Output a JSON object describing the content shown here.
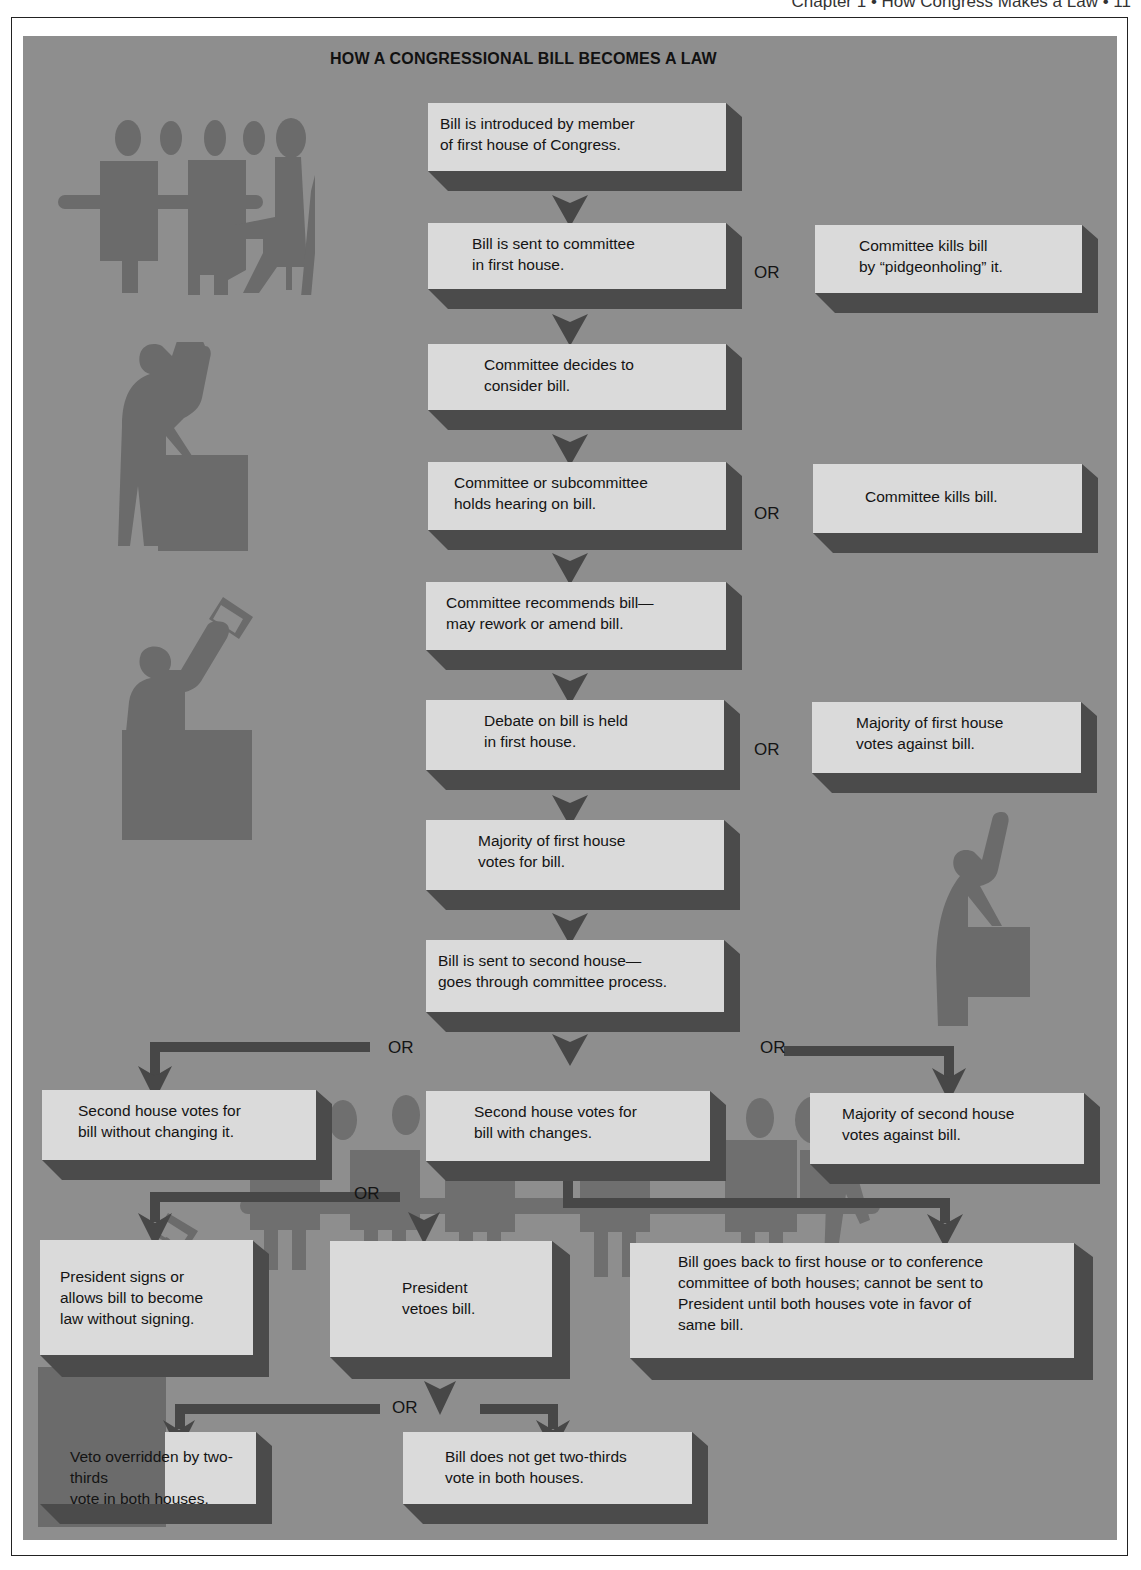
{
  "page": {
    "running_head": "Chapter 1 • How Congress Makes a Law • 11"
  },
  "diagram": {
    "title": "HOW A CONGRESSIONAL BILL BECOMES A LAW",
    "or_label": "OR",
    "colors": {
      "panel": "#8e8e8e",
      "box_face": "#dadada",
      "box_shadow": "#4b4b4b",
      "arrow": "#474747",
      "silhouette": "#6b6b6b"
    },
    "steps": [
      {
        "id": "s1",
        "text": "Bill is introduced by member\nof first house of Congress."
      },
      {
        "id": "s2",
        "text": "Bill is sent to committee\nin first house."
      },
      {
        "id": "s3",
        "text": "Committee decides to\nconsider bill."
      },
      {
        "id": "s4",
        "text": "Committee or subcommittee\nholds hearing on bill."
      },
      {
        "id": "s5",
        "text": "Committee recommends bill—\nmay rework or amend bill."
      },
      {
        "id": "s6",
        "text": "Debate on bill is held\nin first house."
      },
      {
        "id": "s7",
        "text": "Majority of first house\nvotes for bill."
      },
      {
        "id": "s8",
        "text": "Bill is sent to second house—\ngoes through committee process."
      }
    ],
    "alternatives": [
      {
        "id": "a1",
        "text": "Committee kills bill\nby “pidgeonholing” it."
      },
      {
        "id": "a2",
        "text": "Committee kills bill."
      },
      {
        "id": "a3",
        "text": "Majority of first house\nvotes against bill."
      }
    ],
    "second_house": [
      {
        "id": "b1",
        "text": "Second house votes for\nbill without changing it."
      },
      {
        "id": "b2",
        "text": "Second house votes for\nbill with changes."
      },
      {
        "id": "b3",
        "text": "Majority of second house\nvotes against bill."
      }
    ],
    "president": [
      {
        "id": "p1",
        "text": "President signs or\nallows bill to become\nlaw without signing."
      },
      {
        "id": "p2",
        "text": "President\nvetoes bill."
      },
      {
        "id": "p3",
        "text": "Bill goes back to first house or to conference\ncommittee of both houses; cannot be sent to\nPresident until both houses vote in favor of\nsame bill."
      }
    ],
    "veto": [
      {
        "id": "v1",
        "text": "Veto overridden by two-thirds\nvote in both houses."
      },
      {
        "id": "v2",
        "text": "Bill does not get two-thirds\nvote in both houses."
      }
    ],
    "illustrations": [
      "committee-meeting-silhouette",
      "speaker-at-podium-silhouette",
      "voter-raising-ballot-silhouette",
      "speaker-pointing-silhouette",
      "seated-crowd-silhouette"
    ]
  }
}
